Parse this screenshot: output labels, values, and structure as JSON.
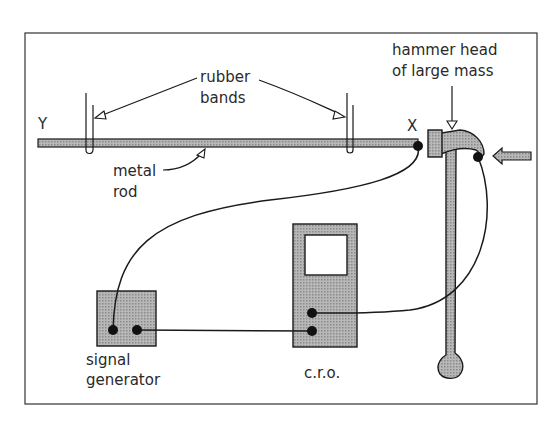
{
  "diagram": {
    "labels": {
      "rubber_bands_line1": "rubber",
      "rubber_bands_line2": "bands",
      "metal_rod_line1": "metal",
      "metal_rod_line2": "rod",
      "end_y": "Y",
      "end_x": "X",
      "hammer_line1": "hammer head",
      "hammer_line2": "of large mass",
      "signal_generator_line1": "signal",
      "signal_generator_line2": "generator",
      "cro": "c.r.o."
    },
    "colors": {
      "stroke": "#1a1a1a",
      "fill_gray": "#a9a9a9",
      "background": "#ffffff"
    }
  }
}
